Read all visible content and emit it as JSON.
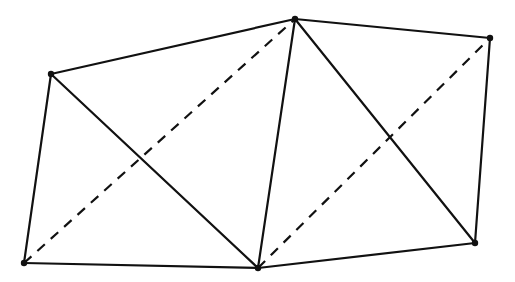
{
  "diagram": {
    "type": "triangulated-hexagon",
    "stroke_color": "#111111",
    "background": "#ffffff",
    "vertices": [
      {
        "id": "A",
        "x": 51,
        "y": 74
      },
      {
        "id": "B",
        "x": 295,
        "y": 19
      },
      {
        "id": "C",
        "x": 490,
        "y": 38
      },
      {
        "id": "D",
        "x": 475,
        "y": 243
      },
      {
        "id": "E",
        "x": 258,
        "y": 268
      },
      {
        "id": "F",
        "x": 24,
        "y": 263
      }
    ],
    "edges": [
      {
        "from": "A",
        "to": "B",
        "style": "solid"
      },
      {
        "from": "B",
        "to": "C",
        "style": "solid"
      },
      {
        "from": "C",
        "to": "D",
        "style": "solid"
      },
      {
        "from": "D",
        "to": "E",
        "style": "solid"
      },
      {
        "from": "E",
        "to": "F",
        "style": "solid"
      },
      {
        "from": "F",
        "to": "A",
        "style": "solid"
      },
      {
        "from": "A",
        "to": "E",
        "style": "solid"
      },
      {
        "from": "B",
        "to": "E",
        "style": "solid"
      },
      {
        "from": "B",
        "to": "D",
        "style": "solid"
      },
      {
        "from": "F",
        "to": "B",
        "style": "dashed"
      },
      {
        "from": "E",
        "to": "C",
        "style": "dashed"
      }
    ]
  }
}
